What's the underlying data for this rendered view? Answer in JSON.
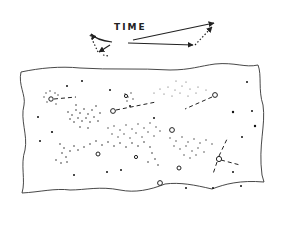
{
  "diagram": {
    "label": "TIME",
    "ink_color": "#222222",
    "background": "#ffffff",
    "time_vectors": [
      {
        "x1": 133,
        "y1": 40,
        "x2": 214,
        "y2": 23,
        "style": "solid",
        "arrow": true
      },
      {
        "x1": 128,
        "y1": 43,
        "x2": 195,
        "y2": 45,
        "style": "solid",
        "arrow": true
      },
      {
        "x1": 195,
        "y1": 45,
        "x2": 213,
        "y2": 25,
        "style": "dotted",
        "arrow": true
      },
      {
        "x1": 112,
        "y1": 42,
        "x2": 90,
        "y2": 34,
        "style": "solid-curve",
        "arrow": true
      },
      {
        "x1": 90,
        "y1": 34,
        "x2": 100,
        "y2": 53,
        "style": "dotted",
        "arrow": false
      },
      {
        "x1": 110,
        "y1": 45,
        "x2": 98,
        "y2": 53,
        "style": "solid",
        "arrow": true
      }
    ],
    "sheet": {
      "type": "torn-paper-outline"
    },
    "stars_open": [
      {
        "x": 51,
        "y": 99
      },
      {
        "x": 113,
        "y": 111
      },
      {
        "x": 215,
        "y": 95
      },
      {
        "x": 172,
        "y": 130
      },
      {
        "x": 96,
        "y": 153
      },
      {
        "x": 218,
        "y": 159
      },
      {
        "x": 178,
        "y": 168
      },
      {
        "x": 157,
        "y": 183
      },
      {
        "x": 136,
        "y": 156
      }
    ],
    "dashed_links": [
      [
        51,
        99,
        75,
        97
      ],
      [
        113,
        111,
        155,
        103
      ],
      [
        215,
        95,
        190,
        107
      ],
      [
        218,
        159,
        240,
        164
      ],
      [
        218,
        159,
        228,
        138
      ],
      [
        218,
        159,
        213,
        174
      ]
    ]
  }
}
